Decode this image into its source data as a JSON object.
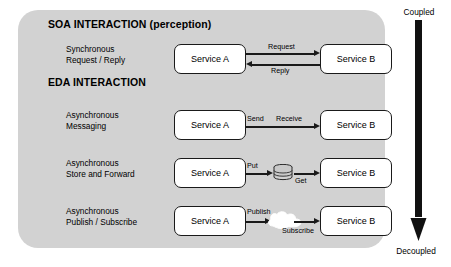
{
  "diagram": {
    "panel_color": "#d2d2d2",
    "line_color": "#1a1a1a",
    "box_fill": "#ffffff",
    "sections": [
      {
        "id": "soa",
        "title": "SOA INTERACTION (perception)"
      },
      {
        "id": "eda",
        "title": "EDA INTERACTION"
      }
    ],
    "rows": [
      {
        "id": "synchronous-request-reply",
        "label_line1": "Synchronous",
        "label_line2": "Request / Reply",
        "source": "Service A",
        "target": "Service B",
        "connector": "double-arrow",
        "forward_label": "Request",
        "reverse_label": "Reply"
      },
      {
        "id": "asynchronous-messaging",
        "label_line1": "Asynchronous",
        "label_line2": "Messaging",
        "source": "Service A",
        "target": "Service B",
        "connector": "single-arrow",
        "forward_label": "Send",
        "reverse_label": "Receive"
      },
      {
        "id": "asynchronous-store-and-forward",
        "label_line1": "Asynchronous",
        "label_line2": "Store and Forward",
        "source": "Service A",
        "target": "Service B",
        "connector": "datastore",
        "forward_label": "Put",
        "reverse_label": "Get",
        "icon": "database-cylinder-icon"
      },
      {
        "id": "asynchronous-publish-subscribe",
        "label_line1": "Asynchronous",
        "label_line2": "Publish / Subscribe",
        "source": "Service A",
        "target": "Service B",
        "connector": "cloud",
        "forward_label": "Publish",
        "reverse_label": "Subscribe",
        "icon": "cloud-icon"
      }
    ],
    "coupling_axis": {
      "top_label": "Coupled",
      "bottom_label": "Decoupled",
      "direction": "downward",
      "color": "#111111"
    }
  }
}
